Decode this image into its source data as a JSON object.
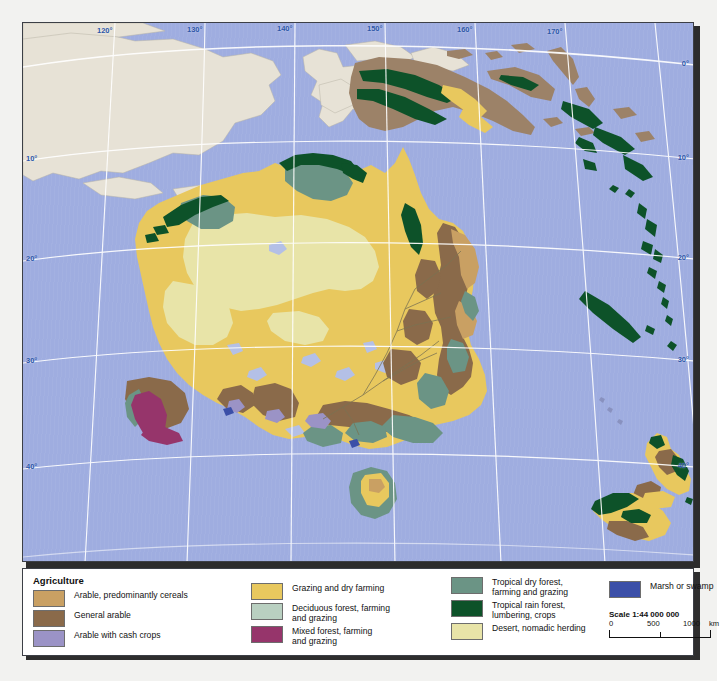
{
  "map": {
    "title": "Agriculture map of Australia and Oceania",
    "scale_label": "Scale 1:44 000 000",
    "scale_ticks": [
      "0",
      "500",
      "1000",
      "km"
    ],
    "longitude_labels": [
      "120°",
      "130°",
      "140°",
      "150°",
      "160°",
      "170°"
    ],
    "latitude_labels_left": [
      "10°",
      "20°",
      "30°",
      "40°"
    ],
    "latitude_labels_right": [
      "0°",
      "10°",
      "20°",
      "30°",
      "40°"
    ],
    "colors": {
      "ocean": "#9fade0",
      "land_outside": "#e7e2d6",
      "arable_cereals": "#c9a063",
      "general_arable": "#8a6a4a",
      "arable_cash_crops": "#9b93c6",
      "grazing_dry_farming": "#e8c85e",
      "deciduous_forest": "#b9d0c1",
      "mixed_forest": "#96356b",
      "tropical_dry_forest": "#6b9485",
      "tropical_rain_forest": "#0d5229",
      "desert_nomadic": "#e8e4a8",
      "marsh_swamp": "#3b4fa8",
      "graticule": "#ffffff",
      "label_blue": "#2d56a8"
    }
  },
  "legend": {
    "title": "Agriculture",
    "column1": [
      {
        "label": "Arable, predominantly cereals",
        "color": "#c9a063"
      },
      {
        "label": "General arable",
        "color": "#8a6a4a"
      },
      {
        "label": "Arable with cash crops",
        "color": "#9b93c6"
      }
    ],
    "column2": [
      {
        "label": "Grazing and dry farming",
        "color": "#e8c85e"
      },
      {
        "label": "Deciduous forest, farming\nand grazing",
        "color": "#b9d0c1"
      },
      {
        "label": "Mixed forest, farming\nand grazing",
        "color": "#96356b"
      }
    ],
    "column3": [
      {
        "label": "Tropical dry forest,\nfarming and grazing",
        "color": "#6b9485"
      },
      {
        "label": "Tropical rain forest,\nlumbering, crops",
        "color": "#0d5229"
      },
      {
        "label": "Desert, nomadic herding",
        "color": "#e8e4a8"
      }
    ],
    "column4": [
      {
        "label": "Marsh or swamp",
        "color": "#3b4fa8"
      }
    ]
  }
}
